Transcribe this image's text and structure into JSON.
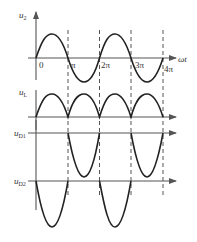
{
  "diagram": {
    "colors": {
      "curve": "#222222",
      "axis": "#555555",
      "text": "#333333"
    },
    "x_axis": {
      "label": "ωt",
      "origin_label": "0",
      "ticks": [
        "π",
        "2π",
        "3π",
        "4π"
      ]
    },
    "panels": [
      {
        "id": "u2",
        "label_main": "u",
        "label_sub": "2",
        "waveform": "sine"
      },
      {
        "id": "uL",
        "label_main": "u",
        "label_sub": "L",
        "waveform": "full-wave rectified (|sin|)"
      },
      {
        "id": "uD1",
        "label_main": "u",
        "label_sub": "D1",
        "waveform": "negative half-cycles during π–2π and 3π–4π"
      },
      {
        "id": "uD2",
        "label_main": "u",
        "label_sub": "D2",
        "waveform": "negative half-cycles during 0–π and 2π–3π"
      }
    ]
  }
}
